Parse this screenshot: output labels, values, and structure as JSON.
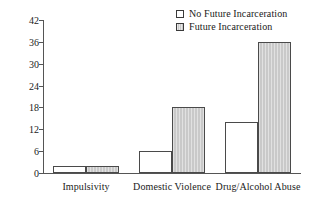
{
  "chart_data": {
    "type": "bar",
    "title": "",
    "subtitle": "",
    "xlabel": "",
    "ylabel": "",
    "categories": [
      "Impulsivity",
      "Domestic Violence",
      "Drug/Alcohol Abuse"
    ],
    "series": [
      {
        "name": "No Future Incarceration",
        "values": [
          2,
          6,
          14
        ],
        "swatch": "solid-white",
        "color": "#ffffff"
      },
      {
        "name": "Future Incarceration",
        "values": [
          2,
          18,
          36
        ],
        "swatch": "hatched",
        "color": "#c9c9c9"
      }
    ],
    "ylim": [
      0,
      42
    ],
    "yticks": [
      0,
      6,
      12,
      18,
      24,
      30,
      36,
      42
    ],
    "ytick_labels": [
      "0",
      "6",
      "12",
      "18",
      "24",
      "30",
      "36",
      "42"
    ],
    "grid": false,
    "legend_position": "top-right",
    "axis_color": "#555555",
    "bar_border_color": "#4a4a4a"
  },
  "legend": {
    "entries": [
      {
        "label": "No Future Incarceration"
      },
      {
        "label": "Future Incarceration"
      }
    ]
  }
}
